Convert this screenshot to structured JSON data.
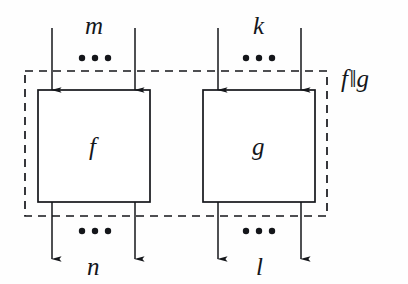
{
  "figure": {
    "name": "parallel-composition-diagram",
    "background_color": "#fefefe",
    "stroke_color": "#14161a",
    "width": 408,
    "height": 284
  },
  "composite": {
    "label": "f‖g",
    "operand_left": "f",
    "operator": "‖",
    "operand_right": "g",
    "boundary_style": "dashed"
  },
  "blocks": [
    {
      "label": "f",
      "input_label": "m",
      "output_label": "n",
      "input_ellipsis": "•••",
      "output_ellipsis": "•••",
      "x": 38,
      "y": 90,
      "width": 112,
      "height": 112
    },
    {
      "label": "g",
      "input_label": "k",
      "output_label": "l",
      "input_ellipsis": "•••",
      "output_ellipsis": "•••",
      "x": 203,
      "y": 90,
      "width": 112,
      "height": 112
    }
  ],
  "labels": {
    "input_left": "m",
    "input_right": "k",
    "output_left": "n",
    "output_right": "l",
    "block_left": "f",
    "block_right": "g",
    "composite": "f",
    "composite_operator": "‖",
    "composite_operand2": "g",
    "ellipsis": "•••"
  },
  "dashed_boundary": {
    "x": 25,
    "y": 71,
    "width": 302,
    "height": 145
  },
  "wires": {
    "input_x_positions": [
      52,
      135,
      218,
      301
    ],
    "output_x_positions": [
      52,
      135,
      218,
      301
    ],
    "input_top_y": 28,
    "input_bottom_y": 90,
    "output_top_y": 202,
    "output_bottom_y": 259
  }
}
